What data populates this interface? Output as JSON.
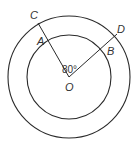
{
  "diagram": {
    "type": "concentric-circles",
    "center": {
      "label": "O",
      "x": 69,
      "y": 77
    },
    "outer_circle": {
      "radius": 61
    },
    "inner_circle": {
      "radius": 42
    },
    "points": {
      "A": {
        "label": "A"
      },
      "B": {
        "label": "B"
      },
      "C": {
        "label": "C"
      },
      "D": {
        "label": "D"
      }
    },
    "angle_label": "80°",
    "stroke_color": "#2a2a2a"
  }
}
